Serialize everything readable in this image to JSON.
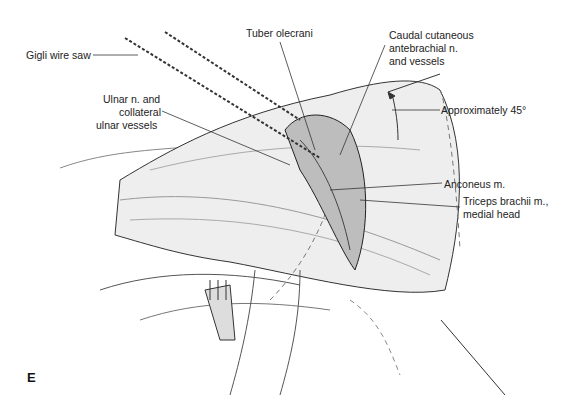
{
  "figure": {
    "panel_letter": "E",
    "labels": {
      "gigli": "Gigli wire saw",
      "tuber": "Tuber olecrani",
      "caudal_l1": "Caudal cutaneous",
      "caudal_l2": "antebrachial n.",
      "caudal_l3": "and vessels",
      "ulnar_l1": "Ulnar n. and",
      "ulnar_l2": "collateral",
      "ulnar_l3": "ulnar vessels",
      "approx": "Approximately 45°",
      "anconeus": "Anconeus m.",
      "triceps_l1": "Triceps brachii m.,",
      "triceps_l2": "medial head"
    },
    "colors": {
      "ink": "#222222",
      "shade": "#bdbdbd",
      "light": "#e6e6e6",
      "background": "#ffffff"
    }
  }
}
